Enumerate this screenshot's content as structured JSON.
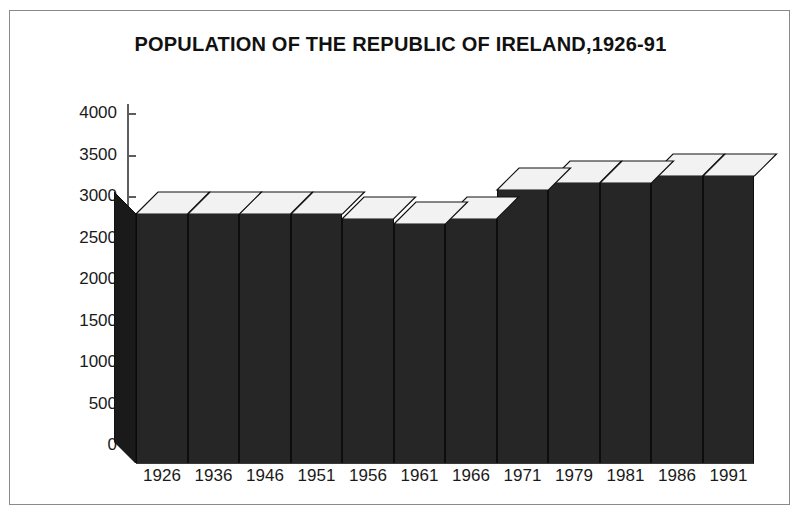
{
  "figure": {
    "title": "POPULATION OF THE REPUBLIC OF IRELAND,1926-91",
    "frame_color": "#8a8a8a",
    "background": "#ffffff"
  },
  "axes": {
    "y_tick_labels": [
      "4000",
      "3500",
      "3000",
      "2500",
      "2000",
      "1500",
      "1000",
      "500",
      "0"
    ],
    "x_tick_labels": [
      "1926",
      "1936",
      "1946",
      "1951",
      "1956",
      "1961",
      "1966",
      "1971",
      "1979",
      "1981",
      "1986",
      "1991"
    ]
  },
  "chart_data": {
    "type": "bar",
    "title": "POPULATION OF THE REPUBLIC OF IRELAND,1926-91",
    "subtitle": "",
    "xlabel": "",
    "ylabel": "",
    "categories": [
      "1926",
      "1936",
      "1946",
      "1951",
      "1956",
      "1961",
      "1966",
      "1971",
      "1979",
      "1981",
      "1986",
      "1991"
    ],
    "values": [
      2800,
      2800,
      2800,
      2790,
      2730,
      2680,
      2730,
      3090,
      3170,
      3170,
      3250,
      3250
    ],
    "ylim": [
      0,
      4000
    ],
    "yticks": [
      0,
      500,
      1000,
      1500,
      2000,
      2500,
      3000,
      3500,
      4000
    ],
    "grid": false,
    "legend": false,
    "legend_position": "none",
    "style": "3d-block-bars",
    "bar_face_color": "#262626",
    "bar_top_color": "#f2f2f2",
    "bar_side_color": "#1a1a1a",
    "axis_color": "#5d5d5d"
  }
}
